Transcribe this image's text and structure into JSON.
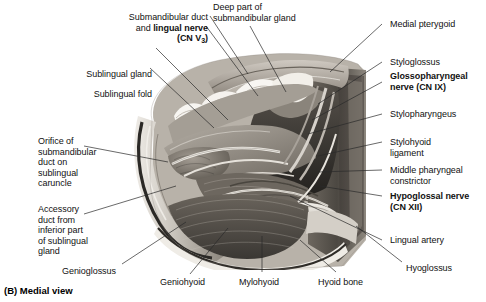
{
  "figure": {
    "caption": "(B) Medial view",
    "view": "Medial view",
    "panel": "B"
  },
  "labels_left": [
    {
      "id": "submandibular-duct-lingual-nerve",
      "text_lines": [
        "Submandibular duct",
        "and lingual nerve",
        "(CN V3)"
      ],
      "plain": "Submandibular duct and lingual nerve (CN V3)",
      "bold_part": "lingual nerve (CN V3)",
      "bold": false
    },
    {
      "id": "sublingual-gland",
      "plain": "Sublingual gland",
      "bold": false
    },
    {
      "id": "sublingual-fold",
      "plain": "Sublingual fold",
      "bold": false
    },
    {
      "id": "orifice-submandibular-duct",
      "plain": "Orifice of\nsubmandibular\nduct on\nsublingual\ncaruncle",
      "bold": false
    },
    {
      "id": "accessory-duct",
      "plain": "Accessory\nduct from\ninferior part\nof sublingual\ngland",
      "bold": false
    }
  ],
  "labels_top": [
    {
      "id": "deep-part-submandibular-gland",
      "plain": "Deep part of\nsubmandibular gland",
      "bold": false
    }
  ],
  "labels_right": [
    {
      "id": "medial-pterygoid",
      "plain": "Medial pterygoid",
      "bold": false
    },
    {
      "id": "styloglossus",
      "plain": "Styloglossus",
      "bold": false
    },
    {
      "id": "glossopharyngeal-nerve",
      "plain": "Glossopharyngeal\nnerve (CN IX)",
      "bold": true
    },
    {
      "id": "stylopharyngeus",
      "plain": "Stylopharyngeus",
      "bold": false
    },
    {
      "id": "stylohyoid-ligament",
      "plain": "Stylohyoid\nligament",
      "bold": false
    },
    {
      "id": "middle-pharyngeal-constrictor",
      "plain": "Middle pharyngeal\nconstrictor",
      "bold": false
    },
    {
      "id": "hypoglossal-nerve",
      "plain": "Hypoglossal nerve\n(CN XII)",
      "bold": true
    },
    {
      "id": "lingual-artery",
      "plain": "Lingual artery",
      "bold": false
    }
  ],
  "labels_bottom": [
    {
      "id": "genioglossus",
      "plain": "Genioglossus",
      "bold": false
    },
    {
      "id": "geniohyoid",
      "plain": "Geniohyoid",
      "bold": false
    },
    {
      "id": "mylohyoid",
      "plain": "Mylohyoid",
      "bold": false
    },
    {
      "id": "hyoid-bone",
      "plain": "Hyoid bone",
      "bold": false
    },
    {
      "id": "hyoglossus",
      "plain": "Hyoglossus",
      "bold": false
    }
  ],
  "colors": {
    "background": "#ffffff",
    "text": "#111111",
    "leader_line": "#2a2a2a",
    "photo_light": "#d9d5cf",
    "photo_mid": "#9a948c",
    "photo_dark": "#4a4views",
    "photo_darkest": "#2b2926"
  }
}
